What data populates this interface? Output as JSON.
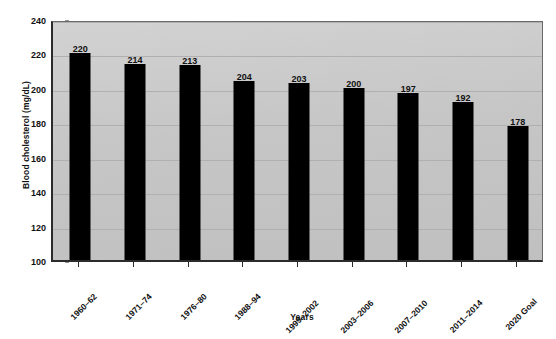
{
  "chart_data": {
    "type": "bar",
    "title": "",
    "xlabel": "Years",
    "ylabel": "Blood cholesterol (mg/dL)",
    "ylim": [
      100,
      240
    ],
    "ytick_step": 20,
    "yticks": [
      100,
      120,
      140,
      160,
      180,
      200,
      220,
      240
    ],
    "grid": true,
    "legend": "none",
    "bar_color": "#000000",
    "plot_background": "#c8c8c8",
    "categories": [
      "1960–62",
      "1971–74",
      "1976–80",
      "1988–94",
      "1999–2002",
      "2003–2006",
      "2007–2010",
      "2011–2014",
      "2020 Goal"
    ],
    "values": [
      220,
      214,
      213,
      204,
      203,
      200,
      197,
      192,
      178
    ],
    "value_labels": [
      "220",
      "214",
      "213",
      "204",
      "203",
      "200",
      "197",
      "192",
      "178"
    ]
  },
  "figure": {
    "caption": ""
  }
}
